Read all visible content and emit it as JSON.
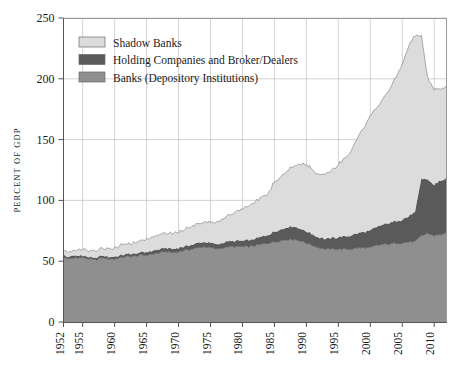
{
  "chart_data": {
    "type": "area",
    "stacked": true,
    "title": "",
    "xlabel": "",
    "ylabel": "PERCENT OF GDP",
    "ylim": [
      0,
      250
    ],
    "xlim": [
      1952,
      2012
    ],
    "yticks": [
      0,
      50,
      100,
      150,
      200,
      250
    ],
    "xticks": [
      1952,
      1955,
      1960,
      1965,
      1970,
      1975,
      1980,
      1985,
      1990,
      1995,
      2000,
      2005,
      2010
    ],
    "grid": true,
    "legend_position": "upper-left-inside",
    "colors": {
      "shadow_banks": "#dcdcdc",
      "holding_companies": "#5a5a5a",
      "banks": "#8f8f8f",
      "axis": "#555555",
      "grid": "#c8c8c8",
      "outline": "#4a4a4a",
      "background": "#ffffff"
    },
    "legend": [
      {
        "label": "Shadow Banks",
        "color": "#dcdcdc",
        "swatch": "shadow-banks-swatch"
      },
      {
        "label": "Holding Companies and Broker/Dealers",
        "color": "#5a5a5a",
        "swatch": "holding-companies-swatch"
      },
      {
        "label": "Banks (Depository Institutions)",
        "color": "#8f8f8f",
        "swatch": "banks-swatch"
      }
    ],
    "x": [
      1952,
      1953,
      1954,
      1955,
      1956,
      1957,
      1958,
      1959,
      1960,
      1961,
      1962,
      1963,
      1964,
      1965,
      1966,
      1967,
      1968,
      1969,
      1970,
      1971,
      1972,
      1973,
      1974,
      1975,
      1976,
      1977,
      1978,
      1979,
      1980,
      1981,
      1982,
      1983,
      1984,
      1985,
      1986,
      1987,
      1988,
      1989,
      1990,
      1991,
      1992,
      1993,
      1994,
      1995,
      1996,
      1997,
      1998,
      1999,
      2000,
      2001,
      2002,
      2003,
      2004,
      2005,
      2006,
      2007,
      2008,
      2009,
      2010,
      2011,
      2012
    ],
    "series": [
      {
        "name": "Banks (Depository Institutions)",
        "color": "#8f8f8f",
        "values": [
          53,
          52,
          53,
          53,
          52,
          51,
          53,
          52,
          52,
          53,
          54,
          54,
          55,
          55,
          56,
          57,
          58,
          57,
          58,
          59,
          60,
          61,
          62,
          61,
          60,
          61,
          62,
          62,
          62,
          62,
          63,
          64,
          65,
          66,
          67,
          68,
          68,
          67,
          65,
          63,
          61,
          60,
          60,
          60,
          60,
          60,
          61,
          61,
          61,
          63,
          64,
          64,
          65,
          65,
          66,
          66,
          71,
          73,
          71,
          72,
          73
        ]
      },
      {
        "name": "Holding Companies and Broker/Dealers",
        "color": "#5a5a5a",
        "values": [
          1.5,
          1.5,
          1.5,
          1.5,
          1.5,
          1.5,
          1.5,
          1.5,
          2,
          2,
          2,
          2,
          2,
          2.5,
          2.5,
          2.5,
          3,
          3,
          3,
          3,
          3.5,
          3.5,
          4,
          4,
          4,
          4,
          4.5,
          4.5,
          5,
          5,
          5.5,
          6,
          6.5,
          8,
          9,
          10,
          10.5,
          10,
          9.5,
          9,
          8.5,
          8.5,
          9,
          9.5,
          10,
          11,
          12,
          13,
          14,
          15,
          16,
          17,
          18,
          19,
          21,
          24,
          47,
          44,
          42,
          44,
          45
        ]
      },
      {
        "name": "Shadow Banks",
        "color": "#dcdcdc",
        "values": [
          4,
          4,
          4.5,
          5,
          5.5,
          6,
          6,
          6.5,
          7,
          8,
          8.5,
          9,
          10,
          11,
          11.5,
          12,
          12.5,
          13,
          13.5,
          14,
          15,
          16,
          16.5,
          17,
          18,
          20,
          22,
          24,
          26,
          28,
          30,
          32,
          34,
          41,
          44,
          46,
          50,
          53,
          55,
          53,
          52,
          53,
          56,
          60,
          64,
          70,
          78,
          86,
          94,
          98,
          103,
          110,
          118,
          128,
          140,
          145,
          117,
          83,
          78,
          76,
          75
        ]
      }
    ],
    "totals_note": {
      "peak_year": 2007,
      "peak_value": 235,
      "first_value": 58,
      "last_value": 193
    }
  }
}
